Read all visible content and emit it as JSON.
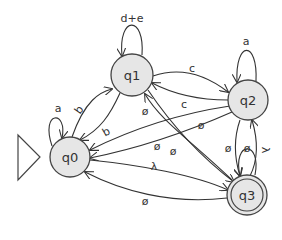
{
  "diagram": {
    "type": "finite-automaton",
    "states": [
      {
        "id": "q0",
        "label": "q0",
        "initial": true,
        "final": false
      },
      {
        "id": "q1",
        "label": "q1",
        "initial": false,
        "final": false
      },
      {
        "id": "q2",
        "label": "q2",
        "initial": false,
        "final": false
      },
      {
        "id": "q3",
        "label": "q3",
        "initial": false,
        "final": true
      }
    ],
    "transitions": [
      {
        "from": "q0",
        "to": "q0",
        "label": "a"
      },
      {
        "from": "q1",
        "to": "q1",
        "label": "d+e"
      },
      {
        "from": "q2",
        "to": "q2",
        "label": "a"
      },
      {
        "from": "q0",
        "to": "q1",
        "label": "b"
      },
      {
        "from": "q1",
        "to": "q0",
        "label": "b"
      },
      {
        "from": "q1",
        "to": "q2",
        "label": "c"
      },
      {
        "from": "q2",
        "to": "q1",
        "label": "ø"
      },
      {
        "from": "q2",
        "to": "q0",
        "label": "c"
      },
      {
        "from": "q3",
        "to": "q1",
        "label": "ø"
      },
      {
        "from": "q1",
        "to": "q3",
        "label": "ø"
      },
      {
        "from": "q2",
        "to": "q0",
        "label": "ø"
      },
      {
        "from": "q0",
        "to": "q3",
        "label": "λ"
      },
      {
        "from": "q3",
        "to": "q0",
        "label": "ø"
      },
      {
        "from": "q2",
        "to": "q3",
        "label": "ø"
      },
      {
        "from": "q3",
        "to": "q2",
        "label": "ø"
      },
      {
        "from": "q3",
        "to": "q3",
        "label": "λ"
      }
    ]
  },
  "labels": {
    "q0": "q0",
    "q1": "q1",
    "q2": "q2",
    "q3": "q3",
    "loop_q0": "a",
    "loop_q1": "d+e",
    "loop_q2": "a",
    "loop_q3": "λ",
    "q0_q1": "b",
    "q1_q0": "b",
    "q1_q2": "c",
    "q2_q0": "c",
    "q2_q1": "ø",
    "q1_q3": "ø",
    "q3_q1": "ø",
    "q2_q0_empty": "ø",
    "q0_q3": "λ",
    "q3_q0": "ø",
    "q2_q3": "ø",
    "q3_q2": "ø"
  }
}
